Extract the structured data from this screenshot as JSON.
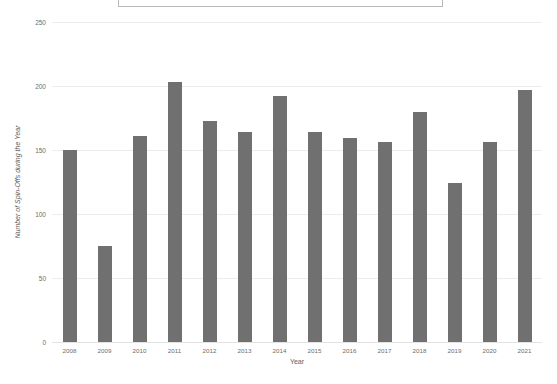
{
  "title": {
    "text": "Number of Spin-Offs per Year",
    "visible_fragment": "clipped-title-box"
  },
  "chart_data": {
    "type": "bar",
    "title": "Number of Spin-Offs per Year",
    "xlabel": "Year",
    "ylabel": "Number of Spin-Offs during the Year",
    "categories": [
      "2008",
      "2009",
      "2010",
      "2011",
      "2012",
      "2013",
      "2014",
      "2015",
      "2016",
      "2017",
      "2018",
      "2019",
      "2020",
      "2021"
    ],
    "values": [
      150,
      75,
      161,
      203,
      173,
      164,
      192,
      164,
      159,
      156,
      180,
      124,
      156,
      197
    ],
    "ylim": [
      0,
      250
    ],
    "yticks": [
      0,
      50,
      100,
      150,
      200,
      250
    ],
    "grid": true,
    "legend": "none",
    "bar_color": "#707070",
    "grid_color": "#ececed"
  }
}
